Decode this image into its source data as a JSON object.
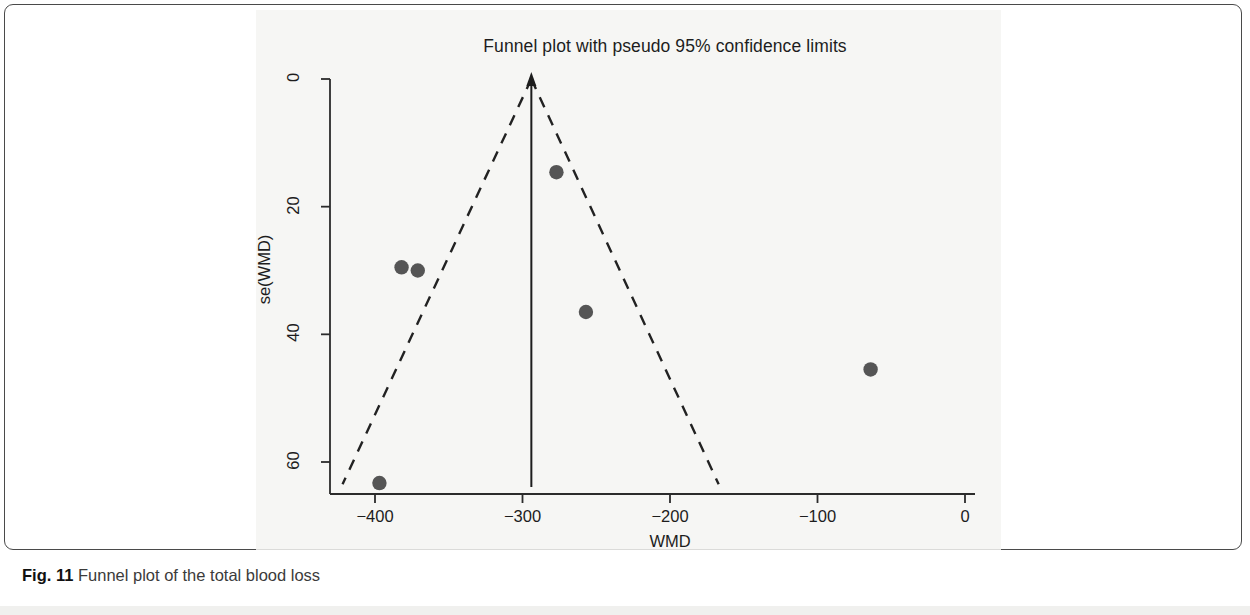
{
  "figure": {
    "caption_label": "Fig. 11",
    "caption_text": "Funnel plot of the total blood loss"
  },
  "chart_data": {
    "type": "scatter",
    "title": "Funnel plot with pseudo 95% confidence limits",
    "xlabel": "WMD",
    "ylabel": "se(WMD)",
    "xlim": [
      -420,
      12
    ],
    "ylim": [
      0,
      66
    ],
    "y_axis_inverted": true,
    "grid": false,
    "legend": null,
    "x_ticks": [
      -400,
      -300,
      -200,
      -100,
      0
    ],
    "x_tick_labels": [
      "-400",
      "-300",
      "-200",
      "-100",
      "0"
    ],
    "y_ticks": [
      0,
      20,
      40,
      60
    ],
    "y_tick_labels": [
      "0",
      "20",
      "40",
      "60"
    ],
    "point_color": "#555555",
    "line_color": "#222222",
    "series": [
      {
        "name": "studies",
        "x": [
          -277,
          -382,
          -371,
          -257,
          -64,
          -397
        ],
        "y": [
          14.6,
          29.5,
          30.0,
          36.5,
          45.5,
          63.3
        ]
      }
    ],
    "pooled_effect": {
      "label": "pooled WMD",
      "value": -294,
      "line_style": "solid"
    },
    "pseudo_ci_limits": {
      "label": "pseudo 95% confidence limits",
      "line_style": "dashed",
      "apex": {
        "x": -294,
        "y": 0
      },
      "left_base": {
        "x": -422,
        "y": 63.5
      },
      "right_base": {
        "x": -167,
        "y": 63.5
      }
    },
    "annotations": []
  }
}
